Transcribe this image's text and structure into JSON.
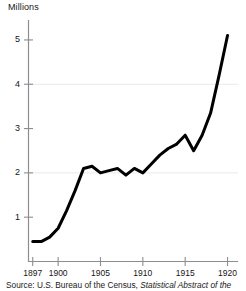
{
  "figure": {
    "axis_title": "Millions",
    "source_label": "Source: U.S. Bureau of the Census,",
    "source_title": " Statistical Abstract of the"
  },
  "chart_data": {
    "type": "line",
    "title": "",
    "subtitle": "",
    "xlabel": "",
    "ylabel": "Millions",
    "xlim": [
      1896.5,
      1921.0
    ],
    "ylim": [
      0,
      5.45
    ],
    "grid": true,
    "grid_axis": "y",
    "gridlines": [
      2,
      4
    ],
    "legend": "none",
    "line_color": "#000000",
    "line_width": 3,
    "background_color": "#ffffff",
    "axis_color": "#8a8a8a",
    "ytick_labels": [
      "1",
      "2",
      "3",
      "4",
      "5"
    ],
    "yticks": [
      1,
      2,
      3,
      4,
      5
    ],
    "xtick_labels": [
      "1897",
      "1900",
      "1905",
      "1910",
      "1915",
      "1920"
    ],
    "xticks": [
      1897,
      1900,
      1905,
      1910,
      1915,
      1920
    ],
    "x": [
      1897,
      1898,
      1899,
      1900,
      1901,
      1902,
      1903,
      1904,
      1905,
      1906,
      1907,
      1908,
      1909,
      1910,
      1911,
      1912,
      1913,
      1914,
      1915,
      1916,
      1917,
      1918,
      1919,
      1920
    ],
    "values": [
      0.45,
      0.45,
      0.55,
      0.75,
      1.15,
      1.6,
      2.1,
      2.15,
      2.0,
      2.05,
      2.1,
      1.95,
      2.1,
      2.0,
      2.2,
      2.4,
      2.55,
      2.65,
      2.85,
      2.5,
      2.85,
      3.35,
      4.2,
      5.1
    ],
    "series": [
      {
        "name": "",
        "values": [
          0.45,
          0.45,
          0.55,
          0.75,
          1.15,
          1.6,
          2.1,
          2.15,
          2.0,
          2.05,
          2.1,
          1.95,
          2.1,
          2.0,
          2.2,
          2.4,
          2.55,
          2.65,
          2.85,
          2.5,
          2.85,
          3.35,
          4.2,
          5.1
        ]
      }
    ]
  }
}
